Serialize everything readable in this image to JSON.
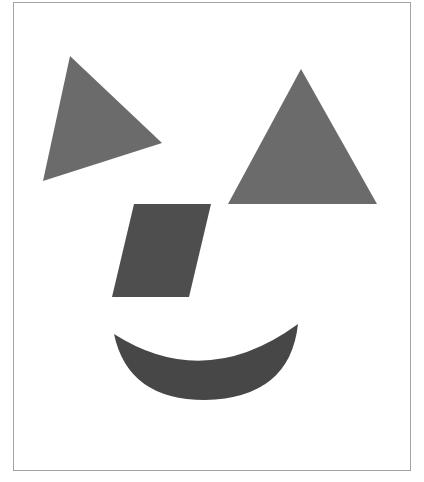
{
  "figure": {
    "colors": {
      "background": "#ffffff",
      "border": "#a3a3a3",
      "triangle_fill": "#6b6b6b",
      "parallelogram_fill": "#4e4e4e",
      "smile_fill": "#474747"
    },
    "shapes": [
      {
        "name": "left-eye-triangle",
        "type": "triangle",
        "points": "70,56 162,143 43,181"
      },
      {
        "name": "right-eye-triangle",
        "type": "triangle",
        "points": "301,69 377,204 228,204"
      },
      {
        "name": "nose-parallelogram",
        "type": "parallelogram",
        "points": "134,204 211,204 189,297 112,297"
      },
      {
        "name": "mouth-crescent",
        "type": "crescent",
        "path": "M114,334 Q205,392 298,324 Q290,398 205,400 Q128,400 114,334 Z"
      }
    ]
  }
}
